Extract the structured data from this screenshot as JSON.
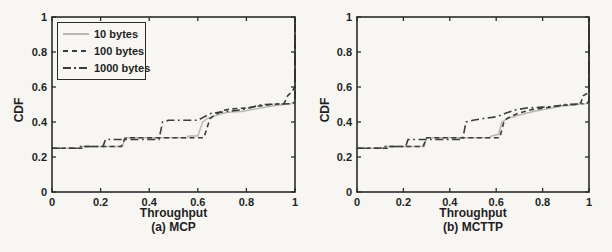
{
  "page": {
    "background": "#f7f6f3",
    "text_color": "#1f1f1f",
    "axis_color": "#2b2b2b",
    "series_dark_color": "#3c3c3c",
    "series_light_color": "#b9b7b2"
  },
  "chart_data": [
    {
      "type": "line",
      "subtype": "cdf-step",
      "caption": "(a) MCP",
      "xlabel": "Throughput",
      "ylabel": "CDF",
      "xlim": [
        0,
        1
      ],
      "ylim": [
        0,
        1
      ],
      "xticks": [
        "0",
        "0.2",
        "0.4",
        "0.6",
        "0.8",
        "1"
      ],
      "yticks": [
        "0",
        "0.2",
        "0.4",
        "0.6",
        "0.8",
        "1"
      ],
      "grid": false,
      "legend": {
        "visible": true,
        "position": "top-left",
        "entries": [
          "10 bytes",
          "100 bytes",
          "1000 bytes"
        ]
      },
      "series": [
        {
          "name": "10 bytes",
          "style": "solid",
          "color": "#b9b7b2",
          "points": [
            [
              0,
              0.25
            ],
            [
              0.12,
              0.25
            ],
            [
              0.12,
              0.26
            ],
            [
              0.29,
              0.26
            ],
            [
              0.3,
              0.31
            ],
            [
              0.555,
              0.31
            ],
            [
              0.56,
              0.32
            ],
            [
              0.6,
              0.32
            ],
            [
              0.62,
              0.4
            ],
            [
              0.64,
              0.42
            ],
            [
              0.68,
              0.44
            ],
            [
              0.72,
              0.455
            ],
            [
              0.78,
              0.46
            ],
            [
              0.84,
              0.475
            ],
            [
              0.9,
              0.49
            ],
            [
              0.955,
              0.5
            ],
            [
              0.99,
              0.505
            ],
            [
              1,
              0.51
            ],
            [
              1,
              1
            ]
          ]
        },
        {
          "name": "100 bytes",
          "style": "dashed",
          "color": "#3c3c3c",
          "points": [
            [
              0,
              0.25
            ],
            [
              0.13,
              0.25
            ],
            [
              0.13,
              0.26
            ],
            [
              0.285,
              0.26
            ],
            [
              0.3,
              0.305
            ],
            [
              0.31,
              0.31
            ],
            [
              0.625,
              0.31
            ],
            [
              0.65,
              0.42
            ],
            [
              0.665,
              0.435
            ],
            [
              0.7,
              0.465
            ],
            [
              0.74,
              0.475
            ],
            [
              0.8,
              0.48
            ],
            [
              0.845,
              0.49
            ],
            [
              0.9,
              0.5
            ],
            [
              0.955,
              0.505
            ],
            [
              0.97,
              0.55
            ],
            [
              0.985,
              0.57
            ],
            [
              1,
              0.6
            ],
            [
              1,
              1
            ]
          ]
        },
        {
          "name": "1000 bytes",
          "style": "dashdot",
          "color": "#3c3c3c",
          "points": [
            [
              0,
              0.25
            ],
            [
              0.1,
              0.25
            ],
            [
              0.11,
              0.26
            ],
            [
              0.21,
              0.26
            ],
            [
              0.22,
              0.3
            ],
            [
              0.44,
              0.3
            ],
            [
              0.455,
              0.4
            ],
            [
              0.48,
              0.41
            ],
            [
              0.6,
              0.41
            ],
            [
              0.62,
              0.425
            ],
            [
              0.655,
              0.45
            ],
            [
              0.72,
              0.46
            ],
            [
              0.78,
              0.47
            ],
            [
              0.825,
              0.485
            ],
            [
              0.865,
              0.5
            ],
            [
              0.99,
              0.505
            ],
            [
              1,
              0.52
            ],
            [
              1,
              1
            ]
          ]
        }
      ]
    },
    {
      "type": "line",
      "subtype": "cdf-step",
      "caption": "(b) MCTTP",
      "xlabel": "Throughput",
      "ylabel": "CDF",
      "xlim": [
        0,
        1
      ],
      "ylim": [
        0,
        1
      ],
      "xticks": [
        "0",
        "0.2",
        "0.4",
        "0.6",
        "0.8",
        "1"
      ],
      "yticks": [
        "0",
        "0.2",
        "0.4",
        "0.6",
        "0.8",
        "1"
      ],
      "grid": false,
      "legend": {
        "visible": false
      },
      "series": [
        {
          "name": "10 bytes",
          "style": "solid",
          "color": "#b9b7b2",
          "points": [
            [
              0,
              0.25
            ],
            [
              0.12,
              0.25
            ],
            [
              0.12,
              0.26
            ],
            [
              0.29,
              0.26
            ],
            [
              0.3,
              0.31
            ],
            [
              0.57,
              0.31
            ],
            [
              0.58,
              0.32
            ],
            [
              0.61,
              0.33
            ],
            [
              0.625,
              0.4
            ],
            [
              0.65,
              0.42
            ],
            [
              0.7,
              0.44
            ],
            [
              0.76,
              0.46
            ],
            [
              0.82,
              0.475
            ],
            [
              0.88,
              0.49
            ],
            [
              0.95,
              0.5
            ],
            [
              0.99,
              0.505
            ],
            [
              1,
              0.51
            ],
            [
              1,
              1
            ]
          ]
        },
        {
          "name": "100 bytes",
          "style": "dashed",
          "color": "#3c3c3c",
          "points": [
            [
              0,
              0.25
            ],
            [
              0.13,
              0.25
            ],
            [
              0.13,
              0.26
            ],
            [
              0.285,
              0.26
            ],
            [
              0.3,
              0.31
            ],
            [
              0.615,
              0.31
            ],
            [
              0.635,
              0.41
            ],
            [
              0.66,
              0.43
            ],
            [
              0.695,
              0.45
            ],
            [
              0.75,
              0.47
            ],
            [
              0.81,
              0.48
            ],
            [
              0.88,
              0.495
            ],
            [
              0.94,
              0.5
            ],
            [
              0.965,
              0.51
            ],
            [
              0.975,
              0.55
            ],
            [
              1,
              0.57
            ],
            [
              1,
              1
            ]
          ]
        },
        {
          "name": "1000 bytes",
          "style": "dashdot",
          "color": "#3c3c3c",
          "points": [
            [
              0,
              0.25
            ],
            [
              0.1,
              0.25
            ],
            [
              0.11,
              0.26
            ],
            [
              0.21,
              0.26
            ],
            [
              0.22,
              0.3
            ],
            [
              0.455,
              0.3
            ],
            [
              0.47,
              0.4
            ],
            [
              0.5,
              0.41
            ],
            [
              0.545,
              0.42
            ],
            [
              0.6,
              0.43
            ],
            [
              0.64,
              0.45
            ],
            [
              0.685,
              0.47
            ],
            [
              0.73,
              0.48
            ],
            [
              0.8,
              0.485
            ],
            [
              0.85,
              0.49
            ],
            [
              0.9,
              0.5
            ],
            [
              0.99,
              0.505
            ],
            [
              1,
              0.52
            ],
            [
              1,
              1
            ]
          ]
        }
      ]
    }
  ]
}
